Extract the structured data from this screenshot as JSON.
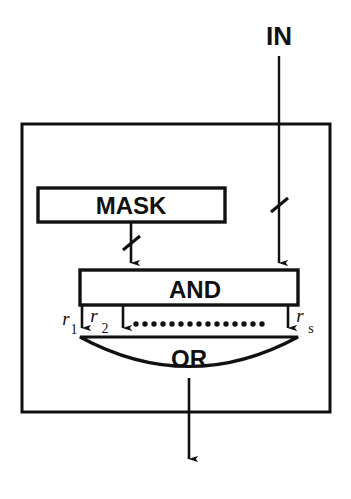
{
  "diagram": {
    "title_label": "",
    "type": "logic-block-diagram",
    "colors": {
      "stroke": "#111111",
      "background": "#ffffff"
    },
    "signals": {
      "input_label": "IN",
      "input_bus_marker": "slash",
      "output_marker": "arrow"
    },
    "blocks": [
      {
        "id": "mask",
        "label": "MASK",
        "shape": "rectangle",
        "x": 38,
        "y": 188,
        "width": 187,
        "height": 34
      },
      {
        "id": "and",
        "label": "AND",
        "shape": "rectangle",
        "x": 80,
        "y": 270,
        "width": 218,
        "height": 35
      },
      {
        "id": "or",
        "label": "OR",
        "shape": "lens-arc",
        "x": 80,
        "y": 337,
        "width": 218,
        "height": 48
      }
    ],
    "outer_boundary": {
      "label": "enclosure",
      "x": 22,
      "y": 124,
      "width": 308,
      "height": 288
    },
    "rails": [
      {
        "id": "r1",
        "base": "r",
        "sub": "1",
        "x": 82
      },
      {
        "id": "r2",
        "base": "r",
        "sub": "2",
        "x": 123
      },
      {
        "id": "rs",
        "base": "r",
        "sub": "s",
        "x": 288
      }
    ],
    "ellipsis": {
      "label": "dotted-continuation",
      "dot_count": 15,
      "x_start": 136,
      "x_end": 262,
      "y": 324
    },
    "connections": [
      {
        "id": "in-to-and",
        "from": "IN",
        "to": "and",
        "bus_slash": true,
        "arrow": true
      },
      {
        "id": "mask-to-and",
        "from": "mask",
        "to": "and",
        "bus_slash": true,
        "arrow": true
      },
      {
        "id": "and-to-or",
        "from": "and",
        "to": "or",
        "bus_slash": false,
        "arrow": true
      },
      {
        "id": "or-to-out",
        "from": "or",
        "to": "output",
        "bus_slash": false,
        "arrow": true
      }
    ]
  }
}
